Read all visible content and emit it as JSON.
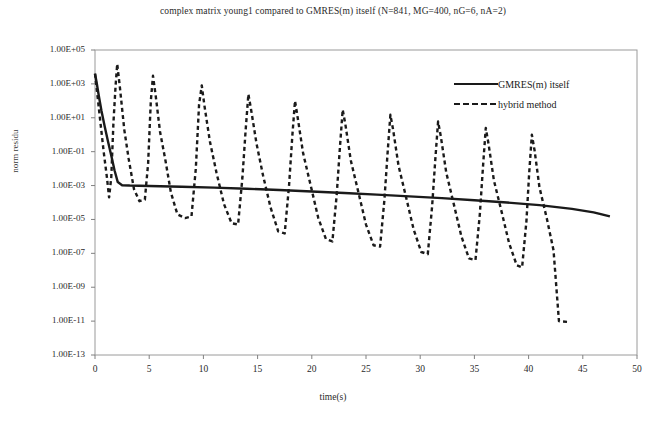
{
  "chart_data": {
    "type": "line",
    "title": "complex matrix young1 compared to GMRES(m) itself (N=841, MG=400, nG=6, nA=2)",
    "xlabel": "time(s)",
    "ylabel": "norm residu",
    "yscale": "log",
    "xlim": [
      0,
      50
    ],
    "ylim": [
      1e-13,
      100000.0
    ],
    "xticks": [
      0,
      5,
      10,
      15,
      20,
      25,
      30,
      35,
      40,
      45,
      50
    ],
    "xtick_labels": [
      "0",
      "5",
      "10",
      "15",
      "20",
      "25",
      "30",
      "35",
      "40",
      "45",
      "50"
    ],
    "yticks": [
      100000.0,
      1000.0,
      10.0,
      0.1,
      0.001,
      1e-05,
      1e-07,
      1e-09,
      1e-11,
      1e-13
    ],
    "ytick_labels": [
      "1.00E+05",
      "1.00E+03",
      "1.00E+01",
      "1.00E-01",
      "1.00E-03",
      "1.00E-05",
      "1.00E-07",
      "1.00E-09",
      "1.00E-11",
      "1.00E-13"
    ],
    "grid": false,
    "legend_position": "upper right",
    "series": [
      {
        "name": "GMRES(m) itself",
        "style": "solid",
        "color": "#1a1a1a",
        "points": [
          [
            0.0,
            4000.0
          ],
          [
            0.15,
            1200.0
          ],
          [
            0.35,
            200.0
          ],
          [
            0.6,
            25.0
          ],
          [
            0.9,
            3.0
          ],
          [
            1.2,
            0.4
          ],
          [
            1.5,
            0.06
          ],
          [
            1.8,
            0.008
          ],
          [
            2.1,
            0.0016
          ],
          [
            2.5,
            0.00105
          ],
          [
            3.2,
            0.001
          ],
          [
            5.0,
            0.00095
          ],
          [
            8.0,
            0.00085
          ],
          [
            11.0,
            0.00075
          ],
          [
            14.0,
            0.00065
          ],
          [
            17.0,
            0.00055
          ],
          [
            20.0,
            0.00045
          ],
          [
            23.0,
            0.00036
          ],
          [
            26.0,
            0.00029
          ],
          [
            29.0,
            0.00023
          ],
          [
            32.0,
            0.00018
          ],
          [
            35.0,
            0.000135
          ],
          [
            38.0,
            0.0001
          ],
          [
            41.0,
            7e-05
          ],
          [
            44.0,
            4.2e-05
          ],
          [
            46.0,
            2.6e-05
          ],
          [
            47.5,
            1.5e-05
          ]
        ]
      },
      {
        "name": "hybrid method",
        "style": "dashed",
        "color": "#1a1a1a",
        "points": [
          [
            0.0,
            4000.0
          ],
          [
            0.4,
            20.0
          ],
          [
            0.8,
            0.1
          ],
          [
            1.1,
            0.003
          ],
          [
            1.3,
            0.0002
          ],
          [
            1.5,
            0.003
          ],
          [
            1.7,
            5.0
          ],
          [
            1.9,
            800.0
          ],
          [
            2.05,
            15000.0
          ],
          [
            2.3,
            600.0
          ],
          [
            2.7,
            2.0
          ],
          [
            3.1,
            0.04
          ],
          [
            3.6,
            0.0006
          ],
          [
            4.1,
            0.00012
          ],
          [
            4.6,
            0.00015
          ],
          [
            4.9,
            0.02
          ],
          [
            5.15,
            100.0
          ],
          [
            5.35,
            3000.0
          ],
          [
            5.6,
            200.0
          ],
          [
            6.0,
            1.5
          ],
          [
            6.5,
            0.03
          ],
          [
            7.0,
            0.0004
          ],
          [
            7.6,
            2e-05
          ],
          [
            8.3,
            1.2e-05
          ],
          [
            8.9,
            1.5e-05
          ],
          [
            9.3,
            0.01
          ],
          [
            9.6,
            60.0
          ],
          [
            9.85,
            800.0
          ],
          [
            10.1,
            50.0
          ],
          [
            10.6,
            0.4
          ],
          [
            11.2,
            0.006
          ],
          [
            11.9,
            8e-05
          ],
          [
            12.6,
            6e-06
          ],
          [
            13.2,
            5e-06
          ],
          [
            13.6,
            0.003
          ],
          [
            13.9,
            2.0
          ],
          [
            14.15,
            250.0
          ],
          [
            14.4,
            30.0
          ],
          [
            14.9,
            0.3
          ],
          [
            15.5,
            0.004
          ],
          [
            16.2,
            5e-05
          ],
          [
            16.9,
            2e-06
          ],
          [
            17.5,
            1.5e-06
          ],
          [
            17.9,
            0.001
          ],
          [
            18.2,
            0.8
          ],
          [
            18.45,
            100.0
          ],
          [
            18.7,
            10.0
          ],
          [
            19.2,
            0.08
          ],
          [
            19.9,
            0.001
          ],
          [
            20.6,
            1.2e-05
          ],
          [
            21.3,
            7e-07
          ],
          [
            21.9,
            5e-07
          ],
          [
            22.3,
            0.0003
          ],
          [
            22.6,
            0.2
          ],
          [
            22.85,
            30.0
          ],
          [
            23.1,
            4.0
          ],
          [
            23.6,
            0.03
          ],
          [
            24.3,
            0.0004
          ],
          [
            25.0,
            5e-06
          ],
          [
            25.7,
            3e-07
          ],
          [
            26.3,
            2.5e-07
          ],
          [
            26.7,
            0.00015
          ],
          [
            27.0,
            0.1
          ],
          [
            27.25,
            15.0
          ],
          [
            27.5,
            2.0
          ],
          [
            28.0,
            0.015
          ],
          [
            28.7,
            0.0002
          ],
          [
            29.4,
            2.5e-06
          ],
          [
            30.1,
            1.2e-07
          ],
          [
            30.7,
            9e-08
          ],
          [
            31.1,
            6e-05
          ],
          [
            31.4,
            0.04
          ],
          [
            31.65,
            6.0
          ],
          [
            31.9,
            0.8
          ],
          [
            32.4,
            0.006
          ],
          [
            33.1,
            8e-05
          ],
          [
            33.8,
            1e-06
          ],
          [
            34.5,
            5e-08
          ],
          [
            35.1,
            4e-08
          ],
          [
            35.5,
            2e-05
          ],
          [
            35.8,
            0.015
          ],
          [
            36.05,
            2.5
          ],
          [
            36.3,
            0.3
          ],
          [
            36.8,
            0.002
          ],
          [
            37.5,
            3e-05
          ],
          [
            38.2,
            4e-07
          ],
          [
            38.9,
            2e-08
          ],
          [
            39.4,
            1.5e-08
          ],
          [
            39.8,
            8e-06
          ],
          [
            40.05,
            0.005
          ],
          [
            40.3,
            1.0
          ],
          [
            40.55,
            0.12
          ],
          [
            41.0,
            0.0008
          ],
          [
            41.7,
            1e-05
          ],
          [
            42.3,
            1.5e-07
          ],
          [
            42.8,
            1e-11
          ],
          [
            43.6,
            9e-12
          ]
        ]
      }
    ]
  }
}
